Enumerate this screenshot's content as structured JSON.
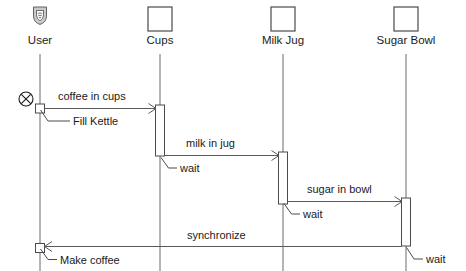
{
  "diagram": {
    "type": "uml-sequence-diagram",
    "title": "",
    "background_color": "#ffffff",
    "line_color": "#4a4a4a",
    "text_color": "#1a1a1a",
    "participants": [
      {
        "id": "user",
        "label": "User",
        "x": 40,
        "icon": "actor-shield-icon",
        "has_box": false
      },
      {
        "id": "cups",
        "label": "Cups",
        "x": 160,
        "icon": "object-box-icon",
        "has_box": true
      },
      {
        "id": "milkjug",
        "label": "Milk Jug",
        "x": 283,
        "icon": "object-box-icon",
        "has_box": true
      },
      {
        "id": "sugarbowl",
        "label": "Sugar Bowl",
        "x": 406,
        "icon": "object-box-icon",
        "has_box": true
      }
    ],
    "start_marker": {
      "symbol": "circled-x",
      "label": "",
      "x": 26,
      "y": 99
    },
    "messages": [
      {
        "id": "m1",
        "label": "coffee in cups",
        "from": "user",
        "to": "cups",
        "y": 105,
        "label_x": 58,
        "label_y": 99,
        "direction": "right"
      },
      {
        "id": "m2",
        "label": "milk in jug",
        "from": "cups",
        "to": "milkjug",
        "y": 152,
        "label_x": 186,
        "label_y": 146,
        "direction": "right"
      },
      {
        "id": "m3",
        "label": "sugar in bowl",
        "from": "milkjug",
        "to": "sugarbowl",
        "y": 198,
        "label_x": 307,
        "label_y": 192,
        "direction": "right"
      },
      {
        "id": "m4",
        "label": "synchronize",
        "from": "sugarbowl",
        "to": "user",
        "y": 245,
        "label_x": 187,
        "label_y": 238,
        "direction": "left"
      }
    ],
    "leader_labels": [
      {
        "id": "l1",
        "label": "Fill Kettle",
        "anchor_x": 40,
        "anchor_y": 107,
        "text_x": 73,
        "text_y": 121
      },
      {
        "id": "l2",
        "label": "wait",
        "anchor_x": 160,
        "anchor_y": 155,
        "text_x": 180,
        "text_y": 168
      },
      {
        "id": "l3",
        "label": "wait",
        "anchor_x": 283,
        "anchor_y": 202,
        "text_x": 303,
        "text_y": 214
      },
      {
        "id": "l4",
        "label": "Make coffee",
        "anchor_x": 40,
        "anchor_y": 247,
        "text_x": 60,
        "text_y": 260
      },
      {
        "id": "l5",
        "label": "wait",
        "anchor_x": 406,
        "anchor_y": 246,
        "text_x": 426,
        "text_y": 259
      }
    ],
    "activations": [
      {
        "id": "a-cups",
        "participant": "cups",
        "x": 160,
        "y_top": 105,
        "y_bottom": 156,
        "width": 9
      },
      {
        "id": "a-milkjug",
        "participant": "milkjug",
        "x": 283,
        "y_top": 152,
        "y_bottom": 204,
        "width": 9
      },
      {
        "id": "a-sugarbowl",
        "participant": "sugarbowl",
        "x": 406,
        "y_top": 198,
        "y_bottom": 246,
        "width": 9
      }
    ],
    "user_event_boxes": [
      {
        "id": "ub1",
        "x": 40,
        "y": 104,
        "size": 9
      },
      {
        "id": "ub2",
        "x": 40,
        "y": 244,
        "size": 9
      }
    ]
  }
}
